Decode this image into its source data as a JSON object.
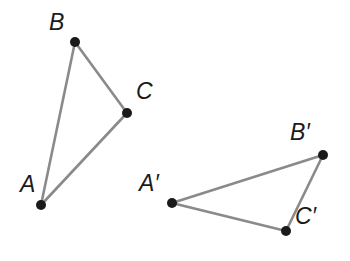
{
  "figure": {
    "background_color": "#ffffff",
    "edge_color": "#8a8a8a",
    "edge_width": 2.6,
    "vertex_color": "#1a1a1a",
    "vertex_radius": 5,
    "label_color": "#1b1b1b",
    "width": 350,
    "height": 261
  },
  "shapes": [
    {
      "name": "triangle-abc",
      "vertices": [
        {
          "id": "A",
          "label": "A",
          "x": 41,
          "y": 205,
          "label_x": 20,
          "label_y": 192
        },
        {
          "id": "B",
          "label": "B",
          "x": 75,
          "y": 42,
          "label_x": 49,
          "label_y": 30
        },
        {
          "id": "C",
          "label": "C",
          "x": 127,
          "y": 113,
          "label_x": 136,
          "label_y": 99
        }
      ],
      "edges": [
        {
          "from": "A",
          "to": "B"
        },
        {
          "from": "B",
          "to": "C"
        },
        {
          "from": "C",
          "to": "A"
        }
      ]
    },
    {
      "name": "triangle-a-prime-b-prime-c-prime",
      "vertices": [
        {
          "id": "Ap",
          "label": "A′",
          "x": 172,
          "y": 203,
          "label_x": 139,
          "label_y": 191
        },
        {
          "id": "Bp",
          "label": "B′",
          "x": 323,
          "y": 155,
          "label_x": 290,
          "label_y": 140
        },
        {
          "id": "Cp",
          "label": "C′",
          "x": 286,
          "y": 231,
          "label_x": 295,
          "label_y": 224
        }
      ],
      "edges": [
        {
          "from": "Ap",
          "to": "Bp"
        },
        {
          "from": "Bp",
          "to": "Cp"
        },
        {
          "from": "Cp",
          "to": "Ap"
        }
      ]
    }
  ]
}
